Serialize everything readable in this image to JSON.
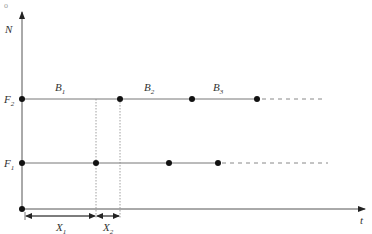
{
  "corner_mark": "o",
  "axes": {
    "y_label": "N",
    "x_label": "t"
  },
  "levels": {
    "F2": {
      "label": "F",
      "sub": "2"
    },
    "F1": {
      "label": "F",
      "sub": "1"
    }
  },
  "segments": [
    {
      "label": "B",
      "sub": "1"
    },
    {
      "label": "B",
      "sub": "2"
    },
    {
      "label": "B",
      "sub": "3"
    }
  ],
  "intervals": [
    {
      "label": "X",
      "sub": "1"
    },
    {
      "label": "X",
      "sub": "2"
    }
  ],
  "colors": {
    "line": "#666666",
    "dot": "#111111",
    "text": "#333333"
  }
}
